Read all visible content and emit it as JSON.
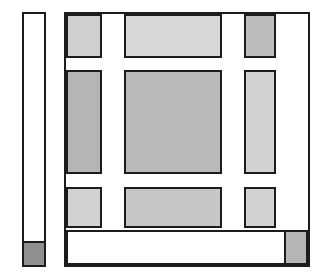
{
  "figure": {
    "canvas": {
      "width": 321,
      "height": 279,
      "background": "#ffffff"
    },
    "palette": {
      "outline": "#1c1c1c",
      "fill_medium": "#b5b5b5",
      "fill_light": "#cfcfcf",
      "fill_dark": "#8f8f8f",
      "fill_white": "#ffffff"
    }
  },
  "chart_data": {
    "type": "diagram",
    "xlabel": "",
    "ylabel": "",
    "units": "pixels",
    "shapes": [
      {
        "id": "left-panel-outline",
        "role": "left narrow panel outline",
        "x": 22,
        "y": 12,
        "width": 24,
        "height": 255,
        "fill": "#ffffff",
        "stroke": "#1c1c1c"
      },
      {
        "id": "left-panel-foot",
        "role": "left panel bottom dark block",
        "x": 22,
        "y": 241,
        "width": 24,
        "height": 26,
        "fill": "#8f8f8f",
        "stroke": "#1c1c1c"
      },
      {
        "id": "main-panel-outline",
        "role": "main panel outer frame",
        "x": 64,
        "y": 12,
        "width": 246,
        "height": 255,
        "fill": "#ffffff",
        "stroke": "#1c1c1c"
      },
      {
        "id": "r1c1",
        "role": "row 1 column 1 block",
        "x": 66,
        "y": 14,
        "width": 36,
        "height": 44,
        "fill": "#cfcfcf",
        "stroke": "#1c1c1c"
      },
      {
        "id": "r1c2",
        "role": "row 1 column 2 block",
        "x": 124,
        "y": 14,
        "width": 98,
        "height": 44,
        "fill": "#d8d8d8",
        "stroke": "#1c1c1c"
      },
      {
        "id": "r1c3",
        "role": "row 1 column 3 block",
        "x": 244,
        "y": 14,
        "width": 32,
        "height": 44,
        "fill": "#bcbcbc",
        "stroke": "#1c1c1c"
      },
      {
        "id": "r2c1",
        "role": "row 2 column 1 block",
        "x": 66,
        "y": 70,
        "width": 36,
        "height": 104,
        "fill": "#b5b5b5",
        "stroke": "#1c1c1c"
      },
      {
        "id": "r2c2",
        "role": "row 2 column 2 block",
        "x": 124,
        "y": 70,
        "width": 98,
        "height": 104,
        "fill": "#b9b9b9",
        "stroke": "#1c1c1c"
      },
      {
        "id": "r2c3",
        "role": "row 2 column 3 block",
        "x": 244,
        "y": 70,
        "width": 32,
        "height": 104,
        "fill": "#d2d2d2",
        "stroke": "#1c1c1c"
      },
      {
        "id": "r3c1",
        "role": "row 3 column 1 block",
        "x": 66,
        "y": 187,
        "width": 36,
        "height": 41,
        "fill": "#d2d2d2",
        "stroke": "#1c1c1c"
      },
      {
        "id": "r3c2",
        "role": "row 3 column 2 block",
        "x": 124,
        "y": 187,
        "width": 98,
        "height": 41,
        "fill": "#c6c6c6",
        "stroke": "#1c1c1c"
      },
      {
        "id": "r3c3",
        "role": "row 3 column 3 block",
        "x": 244,
        "y": 187,
        "width": 32,
        "height": 41,
        "fill": "#d2d2d2",
        "stroke": "#1c1c1c"
      },
      {
        "id": "bottom-strip",
        "role": "main panel bottom white strip",
        "x": 66,
        "y": 230,
        "width": 242,
        "height": 35,
        "fill": "#ffffff",
        "stroke": "#1c1c1c"
      },
      {
        "id": "bottom-right-foot",
        "role": "main panel bottom right gray block",
        "x": 284,
        "y": 230,
        "width": 24,
        "height": 35,
        "fill": "#b5b5b5",
        "stroke": "#1c1c1c"
      }
    ],
    "columns": [
      {
        "label": "column 1",
        "x_start": 66,
        "x_end": 102
      },
      {
        "label": "gap 1",
        "x_start": 102,
        "x_end": 124
      },
      {
        "label": "column 2",
        "x_start": 124,
        "x_end": 222
      },
      {
        "label": "gap 2",
        "x_start": 222,
        "x_end": 244
      },
      {
        "label": "column 3",
        "x_start": 244,
        "x_end": 276
      },
      {
        "label": "gap 3",
        "x_start": 276,
        "x_end": 308
      }
    ],
    "rows": [
      {
        "label": "row 1",
        "y_start": 14,
        "y_end": 58
      },
      {
        "label": "white band 1",
        "y_start": 58,
        "y_end": 70
      },
      {
        "label": "row 2",
        "y_start": 70,
        "y_end": 174
      },
      {
        "label": "white band 2",
        "y_start": 174,
        "y_end": 187
      },
      {
        "label": "row 3",
        "y_start": 187,
        "y_end": 228
      },
      {
        "label": "bottom strip",
        "y_start": 230,
        "y_end": 265
      }
    ]
  }
}
